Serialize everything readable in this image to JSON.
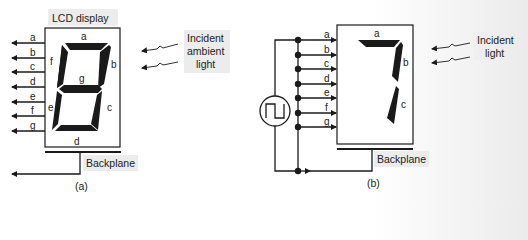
{
  "panel_a": {
    "title": "LCD display",
    "caption": "(a)",
    "input_labels": [
      "a",
      "b",
      "c",
      "d",
      "e",
      "f",
      "g"
    ],
    "segment_labels": {
      "a": "a",
      "b": "b",
      "c": "c",
      "d": "d",
      "e": "e",
      "f": "f",
      "g": "g"
    },
    "backplane_label": "Backplane",
    "light_label_lines": [
      "Incident",
      "ambient",
      "light"
    ],
    "displayed_digit": "8"
  },
  "panel_b": {
    "caption": "(b)",
    "input_labels": [
      "a",
      "b",
      "c",
      "d",
      "e",
      "f",
      "g"
    ],
    "segment_labels": {
      "a": "a",
      "b": "b",
      "c": "c"
    },
    "backplane_label": "Backplane",
    "light_label_lines": [
      "Incident",
      "light"
    ],
    "source_icon": "square-wave-source-icon",
    "displayed_digit": "7"
  },
  "colors": {
    "ink": "#1a1a1a",
    "label_bg": "#ececec"
  }
}
